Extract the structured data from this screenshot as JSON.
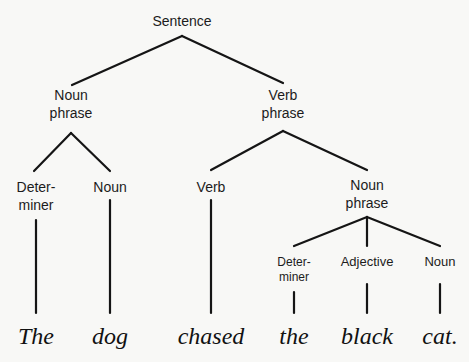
{
  "diagram": {
    "type": "parse-tree",
    "nodes": [
      {
        "id": "s",
        "lines": [
          "Sentence"
        ],
        "x": 182,
        "y": [
          26
        ],
        "size": 14
      },
      {
        "id": "np1",
        "lines": [
          "Noun",
          "phrase"
        ],
        "x": 71,
        "y": [
          100,
          118
        ],
        "size": 14
      },
      {
        "id": "vp",
        "lines": [
          "Verb",
          "phrase"
        ],
        "x": 283,
        "y": [
          100,
          118
        ],
        "size": 14
      },
      {
        "id": "det1",
        "lines": [
          "Deter-",
          "miner"
        ],
        "x": 36,
        "y": [
          192,
          210
        ],
        "size": 14
      },
      {
        "id": "n1",
        "lines": [
          "Noun"
        ],
        "x": 110,
        "y": [
          192
        ],
        "size": 14
      },
      {
        "id": "v",
        "lines": [
          "Verb"
        ],
        "x": 211,
        "y": [
          192
        ],
        "size": 14
      },
      {
        "id": "np2",
        "lines": [
          "Noun",
          "phrase"
        ],
        "x": 367,
        "y": [
          190,
          208
        ],
        "size": 14
      },
      {
        "id": "det2",
        "lines": [
          "Deter-",
          "miner"
        ],
        "x": 294,
        "y": [
          266,
          281
        ],
        "size": 12
      },
      {
        "id": "adj",
        "lines": [
          "Adjective"
        ],
        "x": 367,
        "y": [
          266
        ],
        "size": 13
      },
      {
        "id": "n2",
        "lines": [
          "Noun"
        ],
        "x": 440,
        "y": [
          266
        ],
        "size": 13
      }
    ],
    "edges": [
      [
        182,
        36,
        72,
        85
      ],
      [
        182,
        36,
        283,
        83
      ],
      [
        71,
        133,
        34,
        171
      ],
      [
        71,
        133,
        110,
        171
      ],
      [
        283,
        131,
        211,
        170
      ],
      [
        283,
        131,
        367,
        170
      ],
      [
        367,
        217,
        294,
        246
      ],
      [
        367,
        217,
        367,
        246
      ],
      [
        367,
        217,
        440,
        246
      ],
      [
        36,
        220,
        36,
        313
      ],
      [
        110,
        200,
        110,
        313
      ],
      [
        211,
        200,
        211,
        313
      ],
      [
        294,
        292,
        294,
        313
      ],
      [
        367,
        284,
        367,
        313
      ],
      [
        440,
        284,
        440,
        313
      ]
    ],
    "words": [
      {
        "text": "The",
        "x": 36
      },
      {
        "text": "dog",
        "x": 110
      },
      {
        "text": "chased",
        "x": 211
      },
      {
        "text": "the",
        "x": 294
      },
      {
        "text": "black",
        "x": 367
      },
      {
        "text": "cat.",
        "x": 440
      }
    ],
    "word_baseline": 344,
    "word_size": 24
  }
}
